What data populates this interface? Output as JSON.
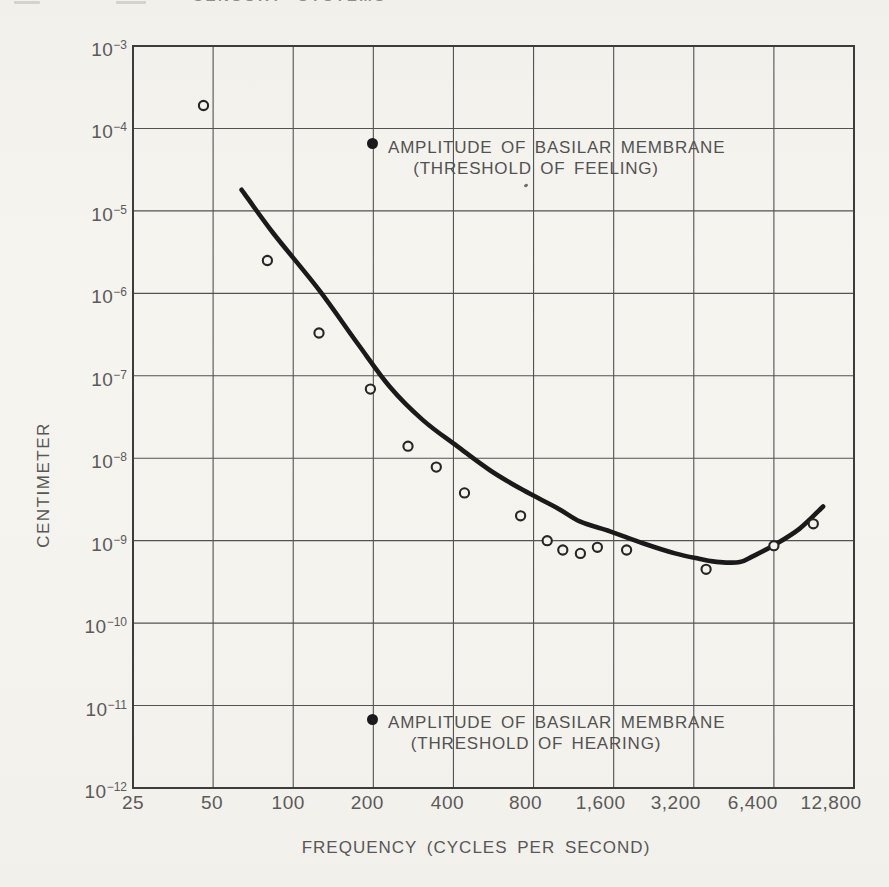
{
  "page": {
    "header_fragment": "SENSORY SYSTEMS"
  },
  "figure": {
    "y_axis_title": "CENTIMETER",
    "x_axis_title": "FREQUENCY (CYCLES PER SECOND)",
    "x_tick_labels": [
      "25",
      "50",
      "100",
      "200",
      "400",
      "800",
      "1,600",
      "3,200",
      "6,400",
      "12,800"
    ],
    "y_tick_base": "10",
    "y_tick_exponents": [
      "−3",
      "−4",
      "−5",
      "−6",
      "−7",
      "−8",
      "−9",
      "−10",
      "−11",
      "−12"
    ],
    "annotations": {
      "feeling": {
        "line1": "AMPLITUDE OF BASILAR MEMBRANE",
        "line2": "(THRESHOLD OF FEELING)"
      },
      "hearing": {
        "line1": "AMPLITUDE OF BASILAR MEMBRANE",
        "line2": "(THRESHOLD OF HEARING)"
      }
    },
    "ink_color": "#4a4a4a",
    "curve_color": "#1a1a1a",
    "paper_color": "#f4f3ee"
  },
  "chart_data": {
    "type": "scatter",
    "title": "",
    "xlabel": "FREQUENCY (CYCLES PER SECOND)",
    "ylabel": "CENTIMETER",
    "x_scale": "log2",
    "y_scale": "log10",
    "xlim": [
      25,
      12800
    ],
    "ylim": [
      1e-12,
      0.001
    ],
    "grid": true,
    "legend_position": "inside-annotations",
    "x_ticks": [
      25,
      50,
      100,
      200,
      400,
      800,
      1600,
      3200,
      6400,
      12800
    ],
    "y_ticks": [
      0.001,
      0.0001,
      1e-05,
      1e-06,
      1e-07,
      1e-08,
      1e-09,
      1e-10,
      1e-11,
      1e-12
    ],
    "series": [
      {
        "name": "AMPLITUDE OF BASILAR MEMBRANE (THRESHOLD OF HEARING)",
        "type": "scatter",
        "marker": "open-circle",
        "x": [
          46,
          80,
          125,
          195,
          270,
          345,
          440,
          715,
          900,
          1030,
          1200,
          1390,
          1790,
          3560,
          6400,
          9000
        ],
        "y": [
          0.00019,
          2.5e-06,
          3.3e-07,
          6.9e-08,
          1.4e-08,
          7.8e-09,
          3.8e-09,
          2e-09,
          1e-09,
          7.7e-10,
          7e-10,
          8.3e-10,
          7.7e-10,
          4.5e-10,
          8.7e-10,
          1.6e-09
        ]
      },
      {
        "name": "AMPLITUDE OF BASILAR MEMBRANE (THRESHOLD OF FEELING)",
        "type": "line",
        "x": [
          64,
          84,
          125,
          174,
          231,
          307,
          413,
          550,
          731,
          980,
          1200,
          1550,
          2060,
          2720,
          3380,
          4000,
          4770,
          5350,
          6400,
          8000,
          9800
        ],
        "y": [
          1.8e-05,
          5.4e-06,
          1.1e-06,
          2.5e-07,
          7.3e-08,
          2.9e-08,
          1.4e-08,
          7.1e-09,
          4.1e-09,
          2.5e-09,
          1.7e-09,
          1.3e-09,
          9.3e-10,
          7e-10,
          6e-10,
          5.5e-10,
          5.5e-10,
          6.5e-10,
          8.8e-10,
          1.4e-09,
          2.6e-09
        ]
      }
    ]
  }
}
